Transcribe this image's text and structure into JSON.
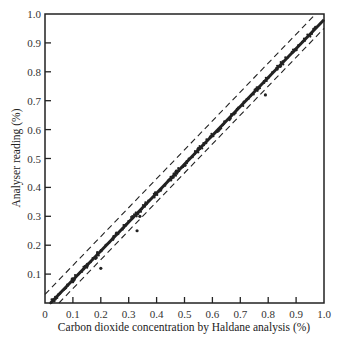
{
  "chart_data": {
    "type": "scatter",
    "title": "",
    "xlabel": "Carbon dioxide concentration by Haldane analysis (%)",
    "ylabel": "Analyser reading (%)",
    "xlim": [
      0,
      1.0
    ],
    "ylim": [
      0,
      1.0
    ],
    "x_ticks": [
      "0",
      "0.1",
      "0.2",
      "0.3",
      "0.4",
      "0.5",
      "0.6",
      "0.7",
      "0.8",
      "0.9",
      "1.0"
    ],
    "y_ticks": [
      "0.1",
      "0.2",
      "0.3",
      "0.4",
      "0.5",
      "0.6",
      "0.7",
      "0.8",
      "0.9",
      "1.0"
    ],
    "grid": false,
    "legend": null,
    "series": [
      {
        "name": "Identity line with dense measurements",
        "style": "solid-thick",
        "x": [
          0.02,
          1.0
        ],
        "y": [
          0.0,
          0.98
        ]
      },
      {
        "name": "Upper tolerance limit",
        "style": "dashed",
        "x": [
          0.0,
          0.97
        ],
        "y": [
          0.03,
          1.0
        ]
      },
      {
        "name": "Lower tolerance limit",
        "style": "dashed",
        "x": [
          0.05,
          1.0
        ],
        "y": [
          0.0,
          0.95
        ]
      },
      {
        "name": "Outliers",
        "style": "points",
        "x": [
          0.2,
          0.33,
          0.34,
          0.79
        ],
        "y": [
          0.12,
          0.25,
          0.3,
          0.72
        ]
      }
    ]
  }
}
